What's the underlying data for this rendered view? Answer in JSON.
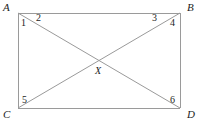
{
  "figure": {
    "kind": "geometry-diagram",
    "stroke_color": "#9a9a9a",
    "label_color": "#1c1c1c",
    "background_color": "#ffffff",
    "width": 202,
    "height": 125
  },
  "rectangle": {
    "left": 18,
    "top": 13,
    "right": 180,
    "bottom": 108
  },
  "vertices": [
    {
      "id": "A",
      "label": "A",
      "x": 18,
      "y": 13,
      "label_x": 3,
      "label_y": 2,
      "corner": "top-left"
    },
    {
      "id": "B",
      "label": "B",
      "x": 180,
      "y": 13,
      "label_x": 187,
      "label_y": 2,
      "corner": "top-right"
    },
    {
      "id": "C",
      "label": "C",
      "x": 18,
      "y": 108,
      "label_x": 3,
      "label_y": 109,
      "corner": "bottom-left"
    },
    {
      "id": "D",
      "label": "D",
      "x": 180,
      "y": 108,
      "label_x": 187,
      "label_y": 109,
      "corner": "bottom-right"
    }
  ],
  "intersection": {
    "id": "X",
    "label": "X",
    "x": 99,
    "y": 61,
    "label_x": 95,
    "label_y": 66
  },
  "diagonals": [
    {
      "id": "AD",
      "from": "A",
      "to": "D"
    },
    {
      "id": "CB",
      "from": "C",
      "to": "B"
    }
  ],
  "sides": [
    {
      "id": "AB",
      "from": "A",
      "to": "B"
    },
    {
      "id": "BD",
      "from": "B",
      "to": "D"
    },
    {
      "id": "DC",
      "from": "D",
      "to": "C"
    },
    {
      "id": "CA",
      "from": "C",
      "to": "A"
    }
  ],
  "angle_labels": [
    {
      "id": "angle-1",
      "label": "1",
      "x": 21,
      "y": 18,
      "at_vertex": "A"
    },
    {
      "id": "angle-2",
      "label": "2",
      "x": 36,
      "y": 13,
      "at_vertex": "A"
    },
    {
      "id": "angle-3",
      "label": "3",
      "x": 152,
      "y": 13,
      "at_vertex": "B"
    },
    {
      "id": "angle-4",
      "label": "4",
      "x": 170,
      "y": 18,
      "at_vertex": "B"
    },
    {
      "id": "angle-5",
      "label": "5",
      "x": 22,
      "y": 95,
      "at_vertex": "C"
    },
    {
      "id": "angle-6",
      "label": "6",
      "x": 170,
      "y": 95,
      "at_vertex": "D"
    }
  ]
}
